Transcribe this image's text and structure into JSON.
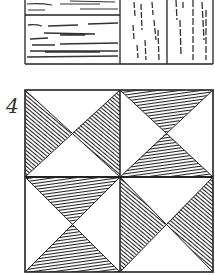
{
  "figure": {
    "label": "4",
    "colors": {
      "ink": "#1a1a1a",
      "paper": "#ffffff",
      "hatch": "#2a2a2a"
    },
    "top_panel": {
      "description": "wood-grain sample panels (partially cropped at top)",
      "sections": [
        {
          "name": "horizontal-grain-upper",
          "grain": "horizontal"
        },
        {
          "name": "horizontal-grain-lower",
          "grain": "horizontal"
        },
        {
          "name": "vertical-grain-left",
          "grain": "vertical"
        },
        {
          "name": "vertical-grain-right",
          "grain": "vertical"
        }
      ]
    },
    "quilt_block": {
      "description": "four hourglass squares with hatched triangles",
      "quadrants": [
        {
          "position": "top-left",
          "shaded": [
            "left",
            "right"
          ]
        },
        {
          "position": "top-right",
          "shaded": [
            "top",
            "bottom"
          ]
        },
        {
          "position": "bottom-left",
          "shaded": [
            "top",
            "bottom"
          ]
        },
        {
          "position": "bottom-right",
          "shaded": [
            "left",
            "right"
          ]
        }
      ]
    }
  }
}
